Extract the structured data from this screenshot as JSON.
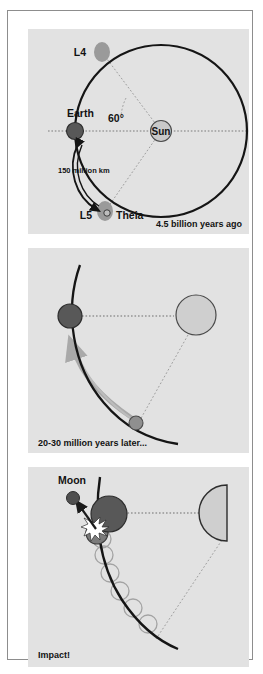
{
  "figure": {
    "title_visible": false,
    "panel_background": "#e2e2e2",
    "page_background": "#ffffff",
    "frame_color": "#8d8d8d"
  },
  "colors": {
    "earth": "#585858",
    "earth_stroke": "#2d2d2d",
    "theia": "#8f8f8f",
    "theia_stroke": "#5a5a5a",
    "sun": "#c9c9c9",
    "sun_stroke": "#4a4a4a",
    "lagrange_blob": "#9a9a9a",
    "orbit": "#151515",
    "dotted": "#7a7a7a",
    "arrow_ghost": "#a9a9a9",
    "moon": "#4f4f4f",
    "text": "#121212",
    "flash": "#ffffff"
  },
  "panels": [
    {
      "id": "panel-1",
      "caption": "4.5 billion years ago",
      "labels": {
        "l4": "L4",
        "l5": "L5",
        "earth": "Earth",
        "theia": "Theia",
        "sun": "Sun",
        "angle": "60°",
        "distance": "150 million km"
      },
      "objects": [
        {
          "name": "sun",
          "label": "Sun",
          "x": 133,
          "y": 102,
          "r": 10.5,
          "fill": "#c9c9c9"
        },
        {
          "name": "earth",
          "label": "Earth",
          "x": 20,
          "y": 102,
          "r": 8.5,
          "fill": "#585858"
        },
        {
          "name": "l4-blob",
          "label": "L4",
          "x": 68,
          "y": 22,
          "fill": "#9a9a9a"
        },
        {
          "name": "l5-blob",
          "label": "L5",
          "x": 72,
          "y": 182,
          "fill": "#9a9a9a"
        },
        {
          "name": "theia-marker",
          "label": "Theia",
          "x": 76,
          "y": 183,
          "r": 3.2
        }
      ],
      "orbit": {
        "cx": 133,
        "cy": 102,
        "r": 86
      },
      "angle_degrees": 60,
      "distance_km": "150 million km"
    },
    {
      "id": "panel-2",
      "caption": "20-30 million years later...",
      "labels": {},
      "objects": [
        {
          "name": "sun",
          "x": 168,
          "y": 65,
          "r": 20,
          "fill": "#cfcfcf"
        },
        {
          "name": "earth",
          "x": 42,
          "y": 68,
          "r": 12,
          "fill": "#585858"
        },
        {
          "name": "theia",
          "x": 108,
          "y": 175,
          "r": 7,
          "fill": "#8f8f8f"
        }
      ],
      "motion_arrow": "theia drifting along orbit toward Earth"
    },
    {
      "id": "panel-3",
      "caption": "Impact!",
      "labels": {
        "moon": "Moon"
      },
      "objects": [
        {
          "name": "sun-half",
          "x": 221,
          "y": 52,
          "r": 28,
          "fill": "#cfcfcf",
          "shape": "half-circle"
        },
        {
          "name": "earth",
          "x": 78,
          "y": 50,
          "r": 18,
          "fill": "#585858"
        },
        {
          "name": "theia-impactor",
          "x": 68,
          "y": 70,
          "r": 11,
          "fill": "#7b7b7b"
        },
        {
          "name": "moon",
          "label": "Moon",
          "x": 44,
          "y": 32,
          "r": 6,
          "fill": "#4f4f4f"
        },
        {
          "name": "impact-flash",
          "x": 66,
          "y": 58
        }
      ],
      "debris_ring_count": 6
    }
  ]
}
